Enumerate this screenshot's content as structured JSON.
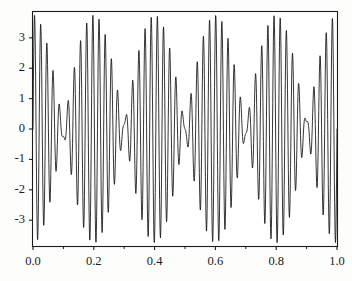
{
  "chart_data": {
    "type": "line",
    "title": "",
    "subtitle": "",
    "xlabel": "",
    "ylabel": "",
    "xlim": [
      0.0,
      1.0
    ],
    "ylim": [
      -3.85,
      3.85
    ],
    "grid": false,
    "legend": null,
    "background_color": "#fdfdfb",
    "line_color": "#121212",
    "frame_color": "#1b1b1b",
    "x_ticks": [
      0.0,
      0.2,
      0.4,
      0.6,
      0.8,
      1.0
    ],
    "x_tick_labels": [
      "0.0",
      "0.2",
      "0.4",
      "0.6",
      "0.8",
      "1.0"
    ],
    "x_minor_ticks": [
      0.1,
      0.3,
      0.5,
      0.7,
      0.9
    ],
    "y_ticks": [
      -3,
      -2,
      -1,
      0,
      1,
      2,
      3
    ],
    "y_tick_labels": [
      "-3",
      "-2",
      "-1",
      "0",
      "1",
      "2",
      "3"
    ],
    "series": [
      {
        "name": "signal",
        "formula": "y = 2*sin(2*pi*47*x) + 1.75*sin(2*pi*52*x)",
        "carrier_cycles": 47,
        "second_cycles": 52,
        "beat_cycles": 10,
        "amplitude_a": 2.0,
        "amplitude_b": 1.75,
        "n_samples": 1400,
        "y_max_observed": 3.72,
        "y_min_observed": -3.66,
        "y_start": 0.0,
        "y_end_approx": 1.95
      }
    ]
  }
}
